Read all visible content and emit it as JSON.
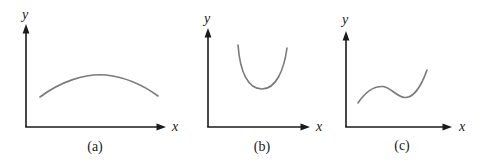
{
  "figure": {
    "background": "#ffffff",
    "colors": {
      "axis": "#1a1a1a",
      "curve": "#7a7a7a",
      "label": "#1a1a1a"
    },
    "panels": [
      {
        "id": "a",
        "caption": "(a)",
        "x_label": "x",
        "y_label": "y",
        "curve_shape": "concave-down arc with a single maximum near the middle"
      },
      {
        "id": "b",
        "caption": "(b)",
        "x_label": "x",
        "y_label": "y",
        "curve_shape": "narrow upward-opening U curve with a single minimum, sitting high above the x-axis"
      },
      {
        "id": "c",
        "caption": "(c)",
        "x_label": "x",
        "y_label": "y",
        "curve_shape": "cubic-like wave: rises to a local maximum, dips to a local minimum, then rises steeply"
      }
    ]
  }
}
